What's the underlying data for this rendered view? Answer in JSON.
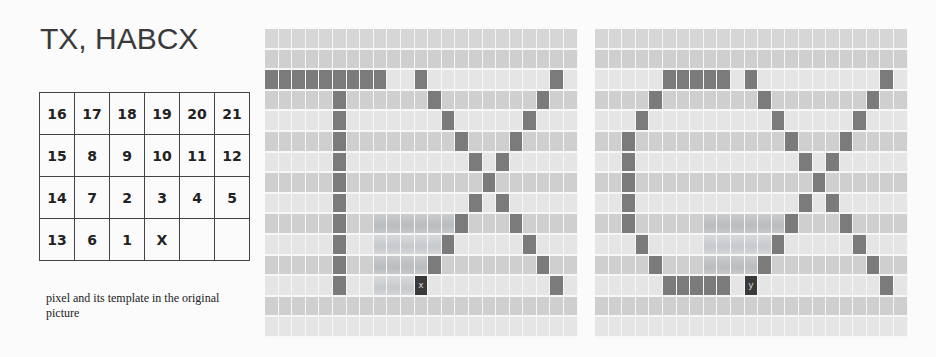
{
  "title": "TX, HABCX",
  "number_table": {
    "rows": [
      [
        "16",
        "17",
        "18",
        "19",
        "20",
        "21"
      ],
      [
        "15",
        "8",
        "9",
        "10",
        "11",
        "12"
      ],
      [
        "14",
        "7",
        "2",
        "3",
        "4",
        "5"
      ],
      [
        "13",
        "6",
        "1",
        "X",
        "",
        ""
      ]
    ]
  },
  "caption": "pixel and its template in the original picture",
  "colors": {
    "stroke": "#7b7b7b",
    "marker": "#3a3a3a",
    "row_light": "#e5e5e5",
    "row_dark": "#cfcfcf",
    "template_tint": "#c7cacd"
  },
  "grids": [
    {
      "name": "TX",
      "left": 265,
      "cols": 23,
      "rows": 15,
      "strokes": [
        [
          2,
          0
        ],
        [
          2,
          1
        ],
        [
          2,
          2
        ],
        [
          2,
          3
        ],
        [
          2,
          4
        ],
        [
          2,
          5
        ],
        [
          2,
          6
        ],
        [
          2,
          7
        ],
        [
          2,
          8
        ],
        [
          3,
          5
        ],
        [
          4,
          5
        ],
        [
          5,
          5
        ],
        [
          6,
          5
        ],
        [
          7,
          5
        ],
        [
          8,
          5
        ],
        [
          9,
          5
        ],
        [
          10,
          5
        ],
        [
          11,
          5
        ],
        [
          12,
          5
        ],
        [
          2,
          11
        ],
        [
          3,
          12
        ],
        [
          4,
          13
        ],
        [
          5,
          14
        ],
        [
          6,
          15
        ],
        [
          7,
          16
        ],
        [
          8,
          15
        ],
        [
          9,
          14
        ],
        [
          10,
          13
        ],
        [
          11,
          12
        ],
        [
          2,
          21
        ],
        [
          3,
          20
        ],
        [
          4,
          19
        ],
        [
          5,
          18
        ],
        [
          6,
          17
        ],
        [
          8,
          17
        ],
        [
          9,
          18
        ],
        [
          10,
          19
        ],
        [
          11,
          20
        ],
        [
          12,
          21
        ]
      ],
      "template": [
        [
          9,
          8
        ],
        [
          9,
          9
        ],
        [
          9,
          10
        ],
        [
          9,
          11
        ],
        [
          9,
          12
        ],
        [
          9,
          13
        ],
        [
          10,
          8
        ],
        [
          10,
          9
        ],
        [
          10,
          10
        ],
        [
          10,
          11
        ],
        [
          10,
          12
        ],
        [
          11,
          8
        ],
        [
          11,
          9
        ],
        [
          11,
          10
        ],
        [
          11,
          11
        ],
        [
          12,
          8
        ],
        [
          12,
          9
        ],
        [
          12,
          10
        ]
      ],
      "marker": {
        "row": 12,
        "col": 11,
        "label": "x"
      }
    },
    {
      "name": "CX",
      "left": 595,
      "cols": 23,
      "rows": 15,
      "strokes": [
        [
          2,
          5
        ],
        [
          2,
          6
        ],
        [
          2,
          7
        ],
        [
          2,
          8
        ],
        [
          2,
          9
        ],
        [
          3,
          4
        ],
        [
          4,
          3
        ],
        [
          5,
          2
        ],
        [
          6,
          2
        ],
        [
          7,
          2
        ],
        [
          8,
          2
        ],
        [
          9,
          2
        ],
        [
          10,
          3
        ],
        [
          11,
          4
        ],
        [
          12,
          5
        ],
        [
          12,
          6
        ],
        [
          12,
          7
        ],
        [
          12,
          8
        ],
        [
          12,
          9
        ],
        [
          2,
          11
        ],
        [
          3,
          12
        ],
        [
          4,
          13
        ],
        [
          5,
          14
        ],
        [
          6,
          15
        ],
        [
          7,
          16
        ],
        [
          8,
          15
        ],
        [
          9,
          14
        ],
        [
          10,
          13
        ],
        [
          11,
          12
        ],
        [
          2,
          21
        ],
        [
          3,
          20
        ],
        [
          4,
          19
        ],
        [
          5,
          18
        ],
        [
          6,
          17
        ],
        [
          8,
          17
        ],
        [
          9,
          18
        ],
        [
          10,
          19
        ],
        [
          11,
          20
        ],
        [
          12,
          21
        ]
      ],
      "template": [
        [
          9,
          8
        ],
        [
          9,
          9
        ],
        [
          9,
          10
        ],
        [
          9,
          11
        ],
        [
          9,
          12
        ],
        [
          9,
          13
        ],
        [
          10,
          8
        ],
        [
          10,
          9
        ],
        [
          10,
          10
        ],
        [
          10,
          11
        ],
        [
          10,
          12
        ],
        [
          11,
          8
        ],
        [
          11,
          9
        ],
        [
          11,
          10
        ],
        [
          11,
          11
        ]
      ],
      "marker": {
        "row": 12,
        "col": 11,
        "label": "y"
      }
    }
  ]
}
